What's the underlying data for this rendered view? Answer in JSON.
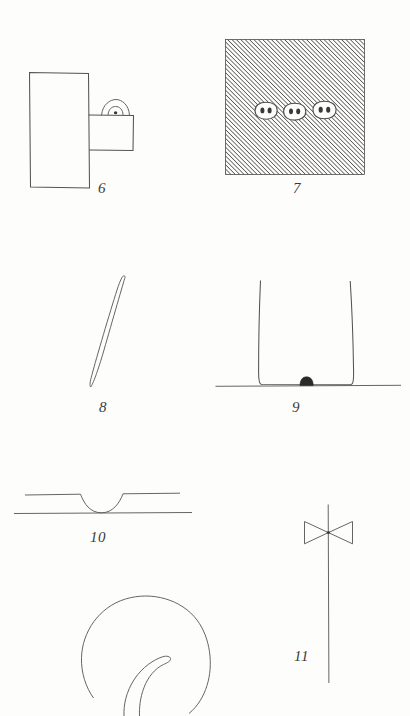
{
  "page": {
    "kind": "plate-of-line-drawings",
    "background_color": "#fdfdfc",
    "ink_color": "#55544f",
    "width": 410,
    "height": 716
  },
  "figures": [
    {
      "number": "6",
      "label": "6",
      "description": "tall vertical rectangle with attached smaller square and small arched loop handle on top",
      "label_x": 98,
      "label_y": 180
    },
    {
      "number": "7",
      "label": "7",
      "description": "diagonally hatched square containing three small rounded plaques each with two dots",
      "label_x": 293,
      "label_y": 180,
      "hatch_angle_degrees": 45,
      "plaque_count": 3,
      "dots_per_plaque": 2
    },
    {
      "number": "8",
      "label": "8",
      "description": "long slender tapered sliver or needle inclined diagonally",
      "label_x": 99,
      "label_y": 399
    },
    {
      "number": "9",
      "label": "9",
      "description": "open U shaped vessel outline standing on a horizontal ground line with a dark blob at its base",
      "label_x": 292,
      "label_y": 399
    },
    {
      "number": "10",
      "label": "10",
      "description": "two horizontal lines, the upper one dipping into a shallow U that meets the lower line",
      "label_x": 90,
      "label_y": 529
    },
    {
      "number": "11",
      "label": "11",
      "description": "long vertical shaft crossed near the top by a bowtie of two opposed triangles",
      "label_x": 294,
      "label_y": 655
    },
    {
      "number": "12",
      "label": "",
      "description": "large circle cropped by the page edge containing a curved pointed leaf or claw form",
      "label_x": 0,
      "label_y": 0
    }
  ]
}
